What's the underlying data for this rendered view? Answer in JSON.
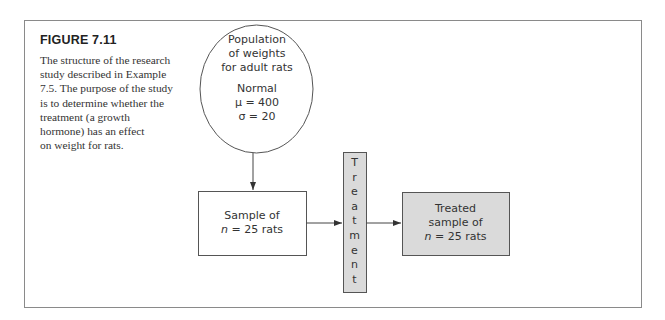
{
  "figure": {
    "label": "FIGURE 7.11",
    "caption_lines": [
      "The structure of the research",
      "study described in Example",
      "7.5. The purpose of the study",
      "is to determine whether the",
      "treatment (a growth",
      "hormone) has an effect",
      "on weight for rats."
    ]
  },
  "diagram": {
    "population": {
      "lines": [
        "Population",
        "of weights",
        "for adult rats"
      ],
      "distribution": "Normal",
      "mu": "μ = 400",
      "sigma": "σ = 20"
    },
    "sample": {
      "line1": "Sample of",
      "n_var": "n",
      "n_rest": " = 25 rats"
    },
    "treatment": {
      "letters": [
        "T",
        "r",
        "e",
        "a",
        "t",
        "m",
        "e",
        "n",
        "t"
      ]
    },
    "treated_sample": {
      "line1": "Treated",
      "line2": "sample of",
      "n_var": "n",
      "n_rest": " = 25 rats"
    },
    "colors": {
      "stroke": "#555555",
      "gray_fill": "#dadada",
      "frame": "#8a8a8a"
    }
  }
}
